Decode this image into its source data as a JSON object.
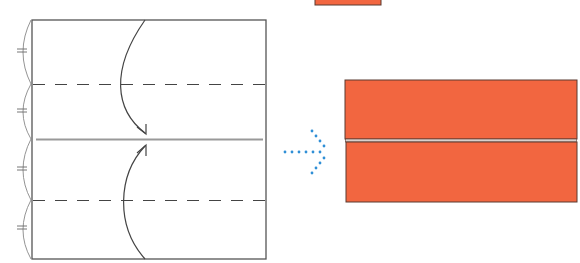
{
  "diagram": {
    "type": "origami-fold-step",
    "paper_color": "#f26640",
    "paper_edge_color": "#5a3a30",
    "line_color": "#555555",
    "arrow_hint_color": "#2f8fd6",
    "steps": [
      {
        "name": "before",
        "description": "Square paper with two dashed valley fold lines and a center crease; top and bottom edges fold to the center"
      },
      {
        "name": "after",
        "description": "Folded rectangle with both flaps meeting at the center"
      }
    ],
    "equal_marks": 4
  }
}
